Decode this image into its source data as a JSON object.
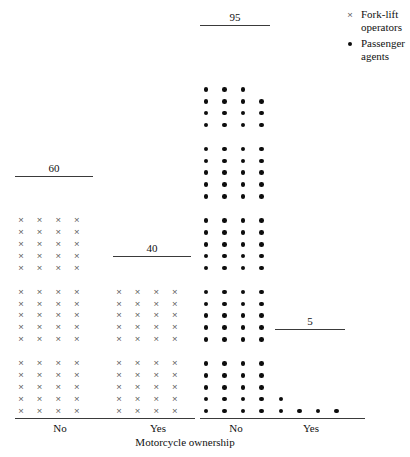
{
  "chart_data": {
    "type": "bar",
    "title": "",
    "subtitle": "",
    "xlabel": "Motorcycle ownership",
    "ylabel": "",
    "grid": false,
    "legend_position": "top-right",
    "unit_note": "Each mark represents one person; groups are drawn as stacked blocks of 5 rows x 4 columns.",
    "categories": [
      "No",
      "Yes"
    ],
    "series": [
      {
        "name": "Fork-lift operators",
        "symbol": "cross",
        "values": [
          60,
          40
        ],
        "data_labels": [
          "60",
          "40"
        ]
      },
      {
        "name": "Passenger agents",
        "symbol": "dot",
        "values": [
          95,
          5
        ],
        "data_labels": [
          "95",
          "5"
        ]
      }
    ],
    "groups": [
      {
        "id": "forklift-no",
        "series": "Fork-lift operators",
        "category": "No",
        "count": 95,
        "count_label": "60",
        "value": 60,
        "symbol": "cross"
      },
      {
        "id": "forklift-yes",
        "series": "Fork-lift operators",
        "category": "Yes",
        "count": 40,
        "count_label": "40",
        "value": 40,
        "symbol": "cross"
      },
      {
        "id": "agents-no",
        "series": "Passenger agents",
        "category": "No",
        "count": 95,
        "count_label": "95",
        "value": 95,
        "symbol": "dot"
      },
      {
        "id": "agents-yes",
        "series": "Passenger agents",
        "category": "Yes",
        "count": 5,
        "count_label": "5",
        "value": 5,
        "symbol": "dot"
      }
    ]
  },
  "axis": {
    "title": "Motorcycle ownership",
    "left_panel": {
      "ticks": [
        "No",
        "Yes"
      ]
    },
    "right_panel": {
      "ticks": [
        "No",
        "Yes"
      ]
    }
  },
  "legend": {
    "items": [
      {
        "symbol": "cross-icon",
        "label_line1": "Fork-lift",
        "label_line2": "operators"
      },
      {
        "symbol": "dot-icon",
        "label_line1": "Passenger",
        "label_line2": "agents"
      }
    ]
  },
  "labels": {
    "count_60": "60",
    "count_40": "40",
    "count_95": "95",
    "count_5": "5",
    "tick_no_left": "No",
    "tick_yes_left": "Yes",
    "tick_no_right": "No",
    "tick_yes_right": "Yes"
  },
  "colors": {
    "background": "#ffffff",
    "dot": "#0d0d0d",
    "cross": "#5b5b5b",
    "rule": "#3a3a3a",
    "text": "#111111"
  },
  "layout": {
    "marks": {
      "col_step": 18.6,
      "row_step": 11.8,
      "block_gap": 12.5,
      "rows_per_block": 5,
      "cols_per_block": 4,
      "baseline_y": 411
    },
    "groups": {
      "forklift-no": {
        "x0": 21,
        "blocks": 3,
        "rule_x": 15,
        "rule_w": 78,
        "rule_y": 176,
        "label_x": 15,
        "label_w": 78,
        "label_y": 162
      },
      "forklift-yes": {
        "x0": 119,
        "blocks": 2,
        "rule_x": 113,
        "rule_w": 78,
        "rule_y": 256,
        "label_x": 113,
        "label_w": 78,
        "label_y": 242
      },
      "agents-no": {
        "x0": 206,
        "blocks": 5,
        "rule_x": 200,
        "rule_w": 70,
        "rule_y": 25,
        "label_x": 200,
        "label_w": 70,
        "label_y": 11
      },
      "agents-yes": {
        "x0": 281,
        "rule_x": 275,
        "rule_w": 70,
        "rule_y": 329,
        "label_x": 275,
        "label_w": 70,
        "label_y": 315
      }
    },
    "axes": {
      "left": {
        "x": 15,
        "w": 180,
        "y": 418
      },
      "right": {
        "x": 200,
        "w": 165,
        "y": 418
      }
    }
  }
}
